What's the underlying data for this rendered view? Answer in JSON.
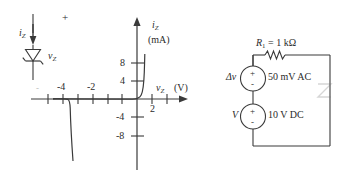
{
  "figure": {
    "ink_color": "#3a3a3a",
    "faint_color": "#b9b9b9"
  },
  "diode_symbol": {
    "current_label": "i",
    "current_sub": "Z",
    "voltage_label": "v",
    "voltage_sub": "Z",
    "polarity_plus": "+"
  },
  "graph": {
    "y_axis_label": "i",
    "y_axis_sub": "Z",
    "y_axis_units": "(mA)",
    "x_axis_label": "v",
    "x_axis_sub": "Z",
    "x_axis_units": "(V)",
    "x_ticks": [
      "-4",
      "-2",
      "2"
    ],
    "x_tick_faint": "-",
    "y_ticks": [
      "8",
      "4",
      "-4",
      "-8"
    ],
    "x_range": [
      -6,
      3
    ],
    "y_range": [
      -10,
      10
    ],
    "breakdown_voltage": -5,
    "forward_knee_voltage": 0.7
  },
  "circuit": {
    "resistor_label": "R",
    "resistor_sub": "1",
    "resistor_value": "= 1 kΩ",
    "ac_source_symbol": "Δv",
    "ac_source_value": "50 mV AC",
    "dc_source_symbol": "V",
    "dc_source_value": "10 V DC",
    "source_plus": "+",
    "source_minus": "-",
    "zener_glyph": "Z"
  }
}
